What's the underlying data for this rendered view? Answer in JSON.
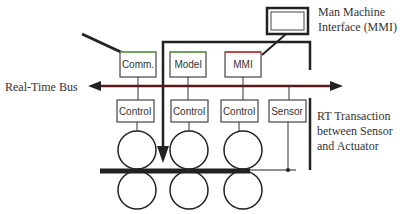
{
  "diagram": {
    "labels": {
      "mmi_title_line1": "Man Machine",
      "mmi_title_line2": "Interface (MMI)",
      "bus": "Real-Time Bus",
      "rt_line1": "RT Transaction",
      "rt_line2": "between Sensor",
      "rt_line3": "and Actuator"
    },
    "top_boxes": [
      {
        "label": "Comm.",
        "accent": "#6aa84f"
      },
      {
        "label": "Model",
        "accent": "#6aa84f"
      },
      {
        "label": "MMI",
        "accent": "#cc3333"
      }
    ],
    "bottom_boxes": [
      {
        "label": "Control"
      },
      {
        "label": "Control"
      },
      {
        "label": "Control"
      },
      {
        "label": "Sensor"
      }
    ],
    "colors": {
      "bus": "#5a1a1a",
      "line": "#222222"
    }
  }
}
